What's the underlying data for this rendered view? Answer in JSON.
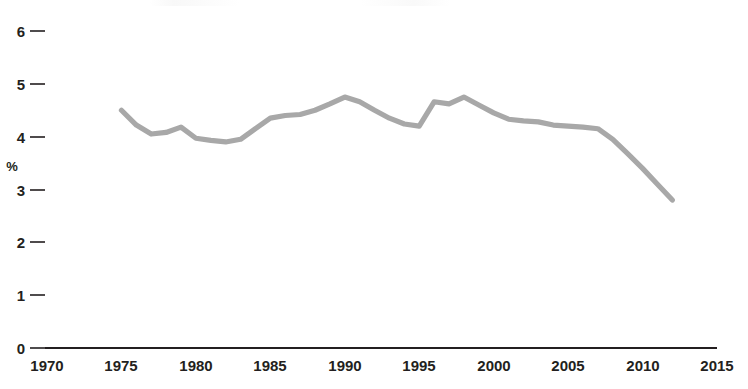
{
  "chart_data": {
    "type": "line",
    "title": "",
    "xlabel": "",
    "ylabel": "%",
    "xlim": [
      1970,
      2015
    ],
    "ylim": [
      0,
      6
    ],
    "grid": false,
    "legend": "none",
    "line_color": "#a8a8a8",
    "axis_color": "#231f20",
    "x_ticks": [
      1970,
      1975,
      1980,
      1985,
      1990,
      1995,
      2000,
      2005,
      2010,
      2015
    ],
    "x_tick_labels": [
      "1970",
      "1975",
      "1980",
      "1985",
      "1990",
      "1995",
      "2000",
      "2005",
      "2010",
      "2015"
    ],
    "y_ticks": [
      0,
      1,
      2,
      3,
      4,
      5,
      6
    ],
    "y_tick_labels": [
      "0",
      "1",
      "2",
      "3",
      "4",
      "5",
      "6"
    ],
    "series": [
      {
        "name": "percent",
        "x": [
          1975,
          1976,
          1977,
          1978,
          1979,
          1980,
          1981,
          1982,
          1983,
          1984,
          1985,
          1986,
          1987,
          1988,
          1989,
          1990,
          1991,
          1992,
          1993,
          1994,
          1995,
          1996,
          1997,
          1998,
          1999,
          2000,
          2001,
          2002,
          2003,
          2004,
          2005,
          2006,
          2007,
          2008,
          2009,
          2010,
          2011,
          2012
        ],
        "values": [
          4.5,
          4.22,
          4.05,
          4.08,
          4.18,
          3.97,
          3.93,
          3.9,
          3.95,
          4.15,
          4.35,
          4.4,
          4.42,
          4.5,
          4.62,
          4.75,
          4.66,
          4.5,
          4.35,
          4.24,
          4.2,
          4.66,
          4.62,
          4.75,
          4.6,
          4.45,
          4.33,
          4.3,
          4.28,
          4.22,
          4.2,
          4.18,
          4.15,
          3.95,
          3.68,
          3.4,
          3.1,
          2.8
        ]
      }
    ]
  },
  "axis": {
    "y_unit": "%"
  }
}
